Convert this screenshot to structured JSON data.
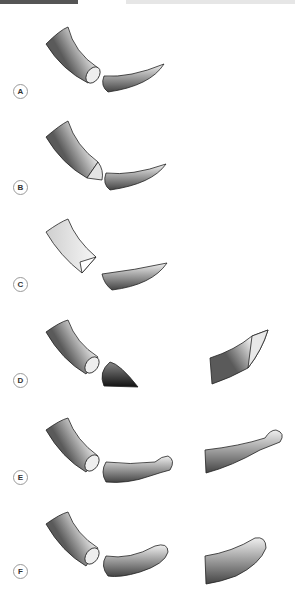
{
  "header": {
    "left_bar": "",
    "right_bar": ""
  },
  "panels": [
    {
      "id": "A",
      "label": "A",
      "description": "cylindrical rod with flat cut end, separated curved tapering tip"
    },
    {
      "id": "B",
      "label": "B",
      "description": "cylindrical rod with bevel-cut end, separated curved tapering tip"
    },
    {
      "id": "C",
      "label": "C",
      "description": "flat ribbon with triangular cut end, separated flat tapered segment"
    },
    {
      "id": "D",
      "label": "D",
      "description": "cylindrical rod with flat end, separated dark conical tip; rod with oblique cut on right"
    },
    {
      "id": "E",
      "label": "E",
      "description": "cylindrical rod with flat end, separated segment with bulbous knob end; segment with knob on right"
    },
    {
      "id": "F",
      "label": "F",
      "description": "cylindrical rod with flat end, separated segment with rounded blunt end; segment with rounded end on right"
    }
  ],
  "colors": {
    "shape_dark": "#5a5a5a",
    "shape_light": "#e8e8e8",
    "outline": "#222222",
    "label_border": "#9a9a9a"
  }
}
